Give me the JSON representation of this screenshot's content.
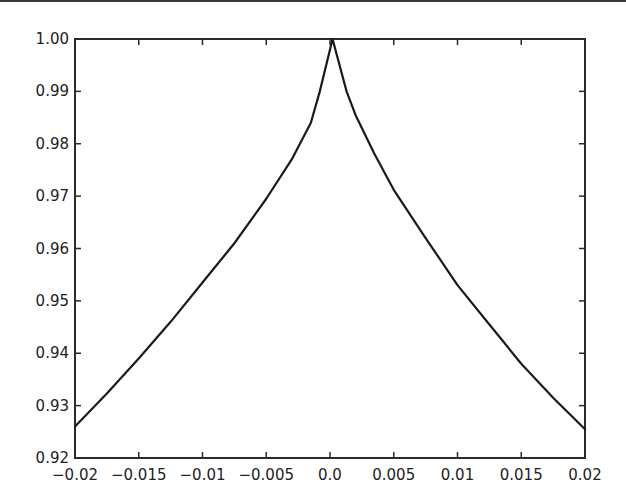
{
  "chart_data": {
    "type": "line",
    "title": "",
    "xlabel": "",
    "ylabel": "",
    "xlim": [
      -0.02,
      0.02
    ],
    "ylim": [
      0.92,
      1.0
    ],
    "grid": false,
    "legend": null,
    "x_ticks": [
      -0.02,
      -0.015,
      -0.01,
      -0.005,
      0.0,
      0.005,
      0.01,
      0.015,
      0.02
    ],
    "x_tick_labels": [
      "−0.02",
      "−0.015",
      "−0.01",
      "−0.005",
      "0.0",
      "0.005",
      "0.01",
      "0.015",
      "0.02"
    ],
    "y_ticks": [
      0.92,
      0.93,
      0.94,
      0.95,
      0.96,
      0.97,
      0.98,
      0.99,
      1.0
    ],
    "y_tick_labels": [
      "0.92",
      "0.93",
      "0.94",
      "0.95",
      "0.96",
      "0.97",
      "0.98",
      "0.99",
      "1.00"
    ],
    "series": [
      {
        "name": "curve",
        "color": "#1a1a1a",
        "x": [
          -0.02,
          -0.0175,
          -0.015,
          -0.0125,
          -0.01,
          -0.0075,
          -0.005,
          -0.003,
          -0.0015,
          -0.0008,
          0.0002,
          0.0013,
          0.002,
          0.0035,
          0.005,
          0.0075,
          0.01,
          0.0125,
          0.015,
          0.0175,
          0.02
        ],
        "y": [
          0.926,
          0.9323,
          0.939,
          0.946,
          0.9535,
          0.961,
          0.9695,
          0.977,
          0.984,
          0.99,
          1.0,
          0.99,
          0.9855,
          0.978,
          0.9712,
          0.962,
          0.953,
          0.9455,
          0.938,
          0.9315,
          0.9255
        ]
      }
    ]
  },
  "colors": {
    "axis": "#2a2a2a",
    "line": "#1a1a1a",
    "background": "#ffffff"
  }
}
